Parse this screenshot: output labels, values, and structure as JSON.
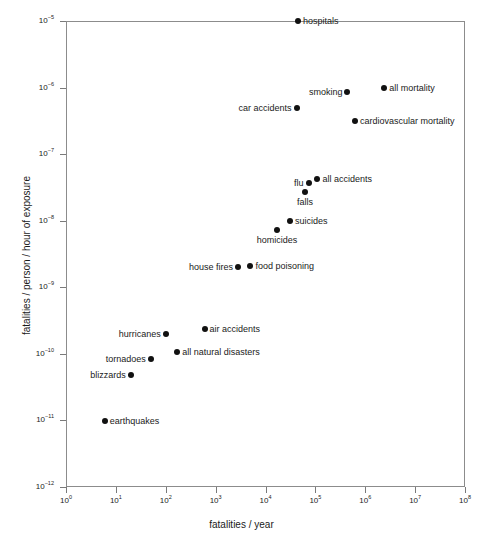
{
  "chart_data": {
    "type": "scatter",
    "title": "",
    "xlabel": "fatalities / year",
    "ylabel": "fatalities / person / hour of exposure",
    "xscale": "log",
    "yscale": "log",
    "xlim": [
      1,
      100000000
    ],
    "ylim": [
      1e-12,
      1e-05
    ],
    "grid": false,
    "legend": "none",
    "xticks": [
      {
        "label_base": "10",
        "label_exp": "0",
        "value": 1
      },
      {
        "label_base": "10",
        "label_exp": "1",
        "value": 10
      },
      {
        "label_base": "10",
        "label_exp": "2",
        "value": 100
      },
      {
        "label_base": "10",
        "label_exp": "3",
        "value": 1000
      },
      {
        "label_base": "10",
        "label_exp": "4",
        "value": 10000
      },
      {
        "label_base": "10",
        "label_exp": "5",
        "value": 100000
      },
      {
        "label_base": "10",
        "label_exp": "6",
        "value": 1000000
      },
      {
        "label_base": "10",
        "label_exp": "7",
        "value": 10000000
      },
      {
        "label_base": "10",
        "label_exp": "8",
        "value": 100000000
      }
    ],
    "yticks": [
      {
        "label_base": "10",
        "label_exp": "-5",
        "value": 1e-05
      },
      {
        "label_base": "10",
        "label_exp": "-6",
        "value": 1e-06
      },
      {
        "label_base": "10",
        "label_exp": "-7",
        "value": 1e-07
      },
      {
        "label_base": "10",
        "label_exp": "-8",
        "value": 1e-08
      },
      {
        "label_base": "10",
        "label_exp": "-9",
        "value": 1e-09
      },
      {
        "label_base": "10",
        "label_exp": "-10",
        "value": 1e-10
      },
      {
        "label_base": "10",
        "label_exp": "-11",
        "value": 1e-11
      },
      {
        "label_base": "10",
        "label_exp": "-12",
        "value": 1e-12
      }
    ],
    "points": [
      {
        "name": "hospitals",
        "x": 45000,
        "y": 1e-05,
        "label": "hospitals",
        "anchor": "right"
      },
      {
        "name": "all mortality",
        "x": 2400000,
        "y": 1e-06,
        "label": "all mortality",
        "anchor": "right"
      },
      {
        "name": "smoking",
        "x": 440000,
        "y": 8.5e-07,
        "label": "smoking",
        "anchor": "left"
      },
      {
        "name": "car accidents",
        "x": 42000,
        "y": 5e-07,
        "label": "car accidents",
        "anchor": "left"
      },
      {
        "name": "cardiovascular mortality",
        "x": 620000,
        "y": 3.2e-07,
        "label": "cardiovascular mortality",
        "anchor": "right"
      },
      {
        "name": "all accidents",
        "x": 110000,
        "y": 4.2e-08,
        "label": "all accidents",
        "anchor": "right"
      },
      {
        "name": "flu",
        "x": 73000,
        "y": 3.7e-08,
        "label": "flu",
        "anchor": "left"
      },
      {
        "name": "falls",
        "x": 62000,
        "y": 2.7e-08,
        "label": "falls",
        "anchor": "below"
      },
      {
        "name": "suicides",
        "x": 31000,
        "y": 1e-08,
        "label": "suicides",
        "anchor": "right"
      },
      {
        "name": "homicides",
        "x": 17000,
        "y": 7.3e-09,
        "label": "homicides",
        "anchor": "below"
      },
      {
        "name": "food poisoning",
        "x": 5000,
        "y": 2.1e-09,
        "label": "food poisoning",
        "anchor": "right"
      },
      {
        "name": "house fires",
        "x": 2800,
        "y": 2e-09,
        "label": "house fires",
        "anchor": "left"
      },
      {
        "name": "air accidents",
        "x": 600,
        "y": 2.4e-10,
        "label": "air accidents",
        "anchor": "right"
      },
      {
        "name": "hurricanes",
        "x": 100,
        "y": 2e-10,
        "label": "hurricanes",
        "anchor": "left"
      },
      {
        "name": "all natural disasters",
        "x": 170,
        "y": 1.05e-10,
        "label": "all natural disasters",
        "anchor": "right"
      },
      {
        "name": "tornadoes",
        "x": 50,
        "y": 8.5e-11,
        "label": "tornadoes",
        "anchor": "left"
      },
      {
        "name": "blizzards",
        "x": 20,
        "y": 4.8e-11,
        "label": "blizzards",
        "anchor": "left"
      },
      {
        "name": "earthquakes",
        "x": 6,
        "y": 9.7e-12,
        "label": "earthquakes",
        "anchor": "right"
      }
    ]
  }
}
